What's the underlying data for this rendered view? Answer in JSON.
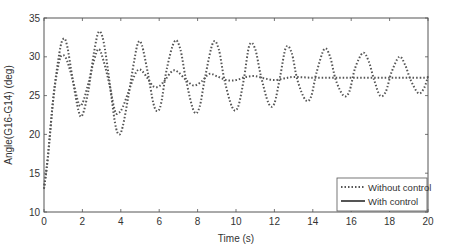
{
  "chart_data": {
    "type": "line",
    "title": "",
    "xlabel": "Time (s)",
    "ylabel": "Angle(G16-G14) (deg)",
    "xlim": [
      0,
      20
    ],
    "ylim": [
      10,
      35
    ],
    "xticks": [
      0,
      2,
      4,
      6,
      8,
      10,
      12,
      14,
      16,
      18,
      20
    ],
    "yticks": [
      10,
      15,
      20,
      25,
      30,
      35
    ],
    "grid": false,
    "legend_position": "lower right",
    "series": [
      {
        "name": "Without control",
        "style": "dotted",
        "color": "#555555",
        "x": [
          0,
          0.2,
          0.5,
          0.8,
          1.0,
          1.2,
          1.5,
          1.8,
          2.0,
          2.3,
          2.6,
          2.85,
          3.1,
          3.4,
          3.7,
          3.9,
          4.1,
          4.4,
          4.7,
          4.9,
          5.1,
          5.4,
          5.7,
          5.9,
          6.1,
          6.4,
          6.8,
          7.1,
          7.4,
          7.8,
          8.1,
          8.4,
          8.8,
          9.1,
          9.4,
          9.8,
          10.1,
          10.4,
          10.7,
          11.0,
          11.3,
          11.7,
          12.0,
          12.3,
          12.6,
          12.9,
          13.2,
          13.6,
          13.9,
          14.2,
          14.6,
          14.9,
          15.2,
          15.6,
          15.9,
          16.2,
          16.6,
          16.9,
          17.2,
          17.5,
          17.8,
          18.1,
          18.5,
          18.8,
          19.1,
          19.5,
          19.8,
          20.0
        ],
        "y": [
          13,
          17,
          25,
          30.5,
          32.3,
          31.5,
          27,
          23,
          22.5,
          25.5,
          30.5,
          33.2,
          32,
          27,
          21.5,
          20,
          21,
          25,
          29.5,
          31.8,
          31.5,
          28,
          24,
          23,
          24,
          28.5,
          32,
          31,
          27,
          23,
          23.5,
          27.5,
          31.8,
          31,
          27,
          23.5,
          23.5,
          27,
          31.5,
          31,
          27.5,
          24,
          24,
          27.5,
          31.2,
          30.5,
          27,
          24.5,
          24.8,
          28,
          31,
          30,
          27,
          25,
          25.5,
          28.5,
          30.5,
          29.5,
          27,
          25,
          25.5,
          28,
          30,
          29,
          27,
          25.3,
          26,
          27.5
        ]
      },
      {
        "name": "With control",
        "style": "solid",
        "color": "#555555",
        "x": [
          0,
          0.2,
          0.5,
          0.8,
          1.0,
          1.2,
          1.5,
          1.8,
          2.0,
          2.3,
          2.6,
          2.85,
          3.1,
          3.4,
          3.7,
          3.9,
          4.1,
          4.4,
          4.7,
          4.9,
          5.1,
          5.4,
          5.7,
          6.0,
          6.3,
          6.7,
          7.0,
          7.4,
          7.8,
          8.2,
          8.6,
          9.0,
          9.5,
          10.0,
          10.5,
          11.0,
          11.5,
          12.0,
          12.5,
          13.0,
          14.0,
          15.0,
          16.0,
          17.0,
          18.0,
          19.0,
          20.0
        ],
        "y": [
          13,
          17,
          25,
          29.5,
          30.2,
          29.5,
          27,
          24,
          24,
          26.5,
          29.5,
          31,
          29.5,
          26.5,
          23,
          22.8,
          23.5,
          25.5,
          27.5,
          28.3,
          28.2,
          27.2,
          26.2,
          26.2,
          27,
          28.2,
          28,
          27,
          26.3,
          26.8,
          27.8,
          27.5,
          27,
          27,
          27.4,
          27.5,
          27.2,
          27,
          27.2,
          27.4,
          27.3,
          27.3,
          27.3,
          27.3,
          27.3,
          27.3,
          27.3
        ]
      }
    ]
  },
  "legend": {
    "items": [
      {
        "label": "Without control",
        "style": "dotted"
      },
      {
        "label": "With control",
        "style": "solid"
      }
    ]
  }
}
